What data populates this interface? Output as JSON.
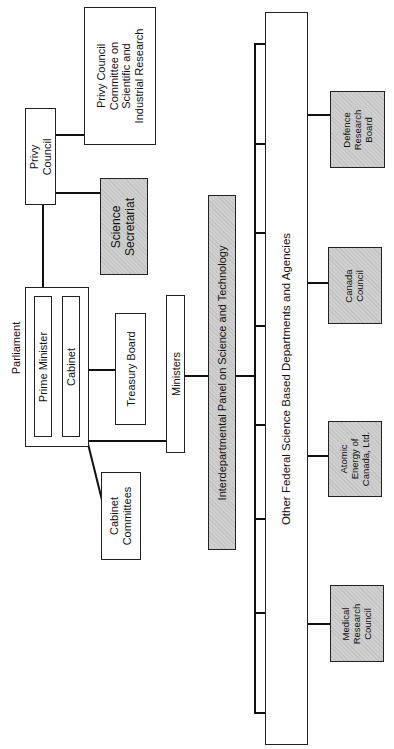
{
  "diagram": {
    "type": "organizational-chart",
    "orientation": "rotated-90-ccw",
    "nodes": {
      "privy_council": {
        "line1": "Privy",
        "line2": "Council"
      },
      "privy_committee": {
        "line1": "Privy Council",
        "line2": "Committee on",
        "line3": "Scientific and",
        "line4": "Industrial Research"
      },
      "science_secretariat": {
        "line1": "Science",
        "line2": "Secretariat"
      },
      "parliament": {
        "label": "Parliament"
      },
      "prime_minister": {
        "label": "Prime Minister"
      },
      "cabinet": {
        "label": "Cabinet"
      },
      "treasury_board": {
        "label": "Treasury Board"
      },
      "ministers": {
        "label": "Ministers"
      },
      "cabinet_committees": {
        "line1": "Cabinet",
        "line2": "Committees"
      },
      "interdepartmental_panel": {
        "label": "Interdepartmental Panel on Science and Technology"
      },
      "other_federal": {
        "label": "Other Federal Science Based Departments and Agencies"
      },
      "defence_research_board": {
        "line1": "Defence",
        "line2": "Research",
        "line3": "Board"
      },
      "canada_council": {
        "line1": "Canada",
        "line2": "Council"
      },
      "atomic_energy": {
        "line1": "Atomic",
        "line2": "Energy of",
        "line3": "Canada, Ltd."
      },
      "medical_research_council": {
        "line1": "Medical",
        "line2": "Research",
        "line3": "Council"
      }
    },
    "colors": {
      "line": "#111111",
      "shaded_fill": "#cfcfcf",
      "plain_fill": "#ffffff"
    }
  }
}
